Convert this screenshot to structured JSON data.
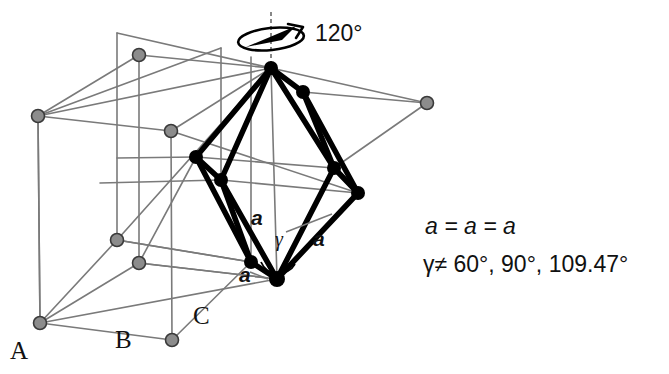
{
  "figure": {
    "background_color": "#ffffff",
    "lattice_color": "#7a7a7a",
    "lattice_node_fill": "#8c8c8c",
    "lattice_node_stroke": "#3a3a3a",
    "cell_color": "#000000"
  },
  "rotation": {
    "label": "120°",
    "icon": "rotation-arrow-icon",
    "axis": "vertical-dashed-axis"
  },
  "stacking_labels": [
    {
      "name": "A",
      "text": "A"
    },
    {
      "name": "B",
      "text": "B"
    },
    {
      "name": "C",
      "text": "C"
    }
  ],
  "edge_labels": [
    {
      "name": "edge-a-left",
      "text": "a"
    },
    {
      "name": "edge-a-right",
      "text": "a"
    },
    {
      "name": "edge-a-bottom",
      "text": "a"
    }
  ],
  "angle_label": {
    "name": "gamma",
    "text": "γ"
  },
  "legend": {
    "line1": "a = a = a",
    "line2": "γ≠ 60°, 90°, 109.47°",
    "line2_symbol": "γ",
    "line2_rest": "≠ 60°, 90°, 109.47°"
  },
  "geometry": {
    "rhombohedron_vertices": [
      {
        "name": "apex-top",
        "x": 271,
        "y": 68
      },
      {
        "name": "upper-right",
        "x": 303,
        "y": 92
      },
      {
        "name": "upper-left",
        "x": 196,
        "y": 157
      },
      {
        "name": "mid-left",
        "x": 221,
        "y": 180
      },
      {
        "name": "mid-right",
        "x": 334,
        "y": 168
      },
      {
        "name": "right-lower",
        "x": 358,
        "y": 193
      },
      {
        "name": "lower-left",
        "x": 251,
        "y": 262
      },
      {
        "name": "bottom-vertex",
        "x": 277,
        "y": 279
      }
    ],
    "lattice_nodes": [
      {
        "name": "node-top-left-upper",
        "x": 139,
        "y": 55
      },
      {
        "name": "node-left-upper",
        "x": 38,
        "y": 116
      },
      {
        "name": "node-mid-upper",
        "x": 171,
        "y": 131
      },
      {
        "name": "node-far-right",
        "x": 427,
        "y": 103
      },
      {
        "name": "node-left-mid",
        "x": 117,
        "y": 240
      },
      {
        "name": "node-mid-lower",
        "x": 139,
        "y": 263
      },
      {
        "name": "node-bottom-left",
        "x": 40,
        "y": 323
      },
      {
        "name": "node-bottom-mid",
        "x": 172,
        "y": 340
      }
    ]
  }
}
